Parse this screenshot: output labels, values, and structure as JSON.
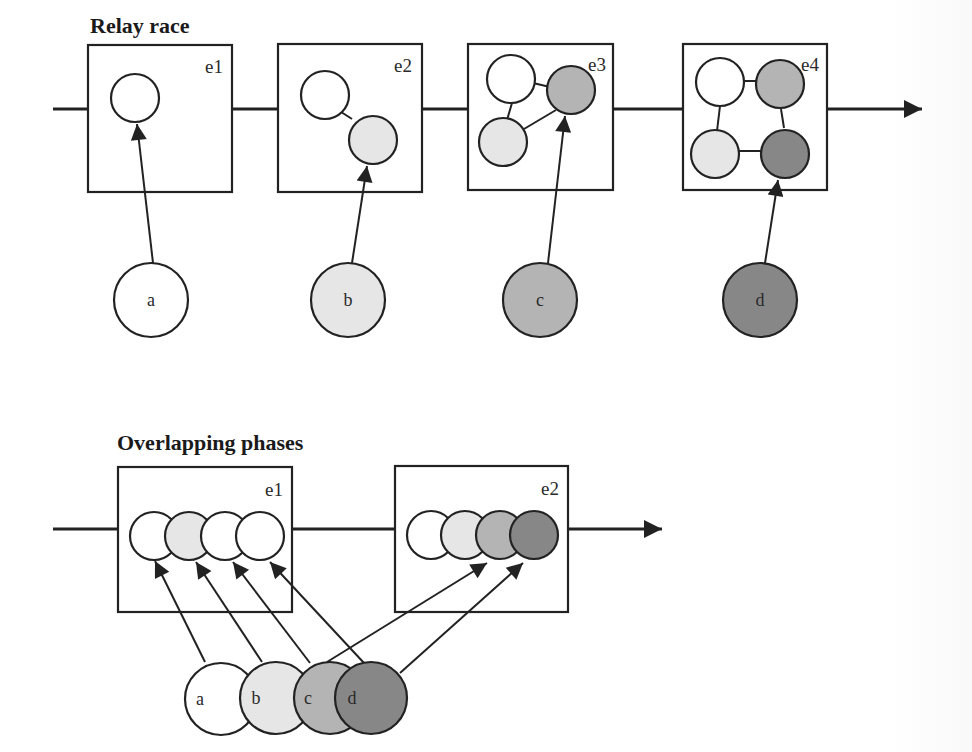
{
  "colors": {
    "white": "#ffffff",
    "light": "#e6e6e6",
    "medium": "#b4b4b4",
    "dark": "#878787",
    "stroke": "#222222"
  },
  "relay": {
    "title": "Relay race",
    "events": [
      {
        "label": "e1"
      },
      {
        "label": "e2"
      },
      {
        "label": "e3"
      },
      {
        "label": "e4"
      }
    ],
    "agents": [
      {
        "label": "a",
        "shade": "white"
      },
      {
        "label": "b",
        "shade": "light"
      },
      {
        "label": "c",
        "shade": "medium"
      },
      {
        "label": "d",
        "shade": "dark"
      }
    ]
  },
  "overlap": {
    "title": "Overlapping phases",
    "events": [
      {
        "label": "e1"
      },
      {
        "label": "e2"
      }
    ],
    "agents": [
      {
        "label": "a",
        "shade": "white"
      },
      {
        "label": "b",
        "shade": "light"
      },
      {
        "label": "c",
        "shade": "medium"
      },
      {
        "label": "d",
        "shade": "dark"
      }
    ]
  }
}
